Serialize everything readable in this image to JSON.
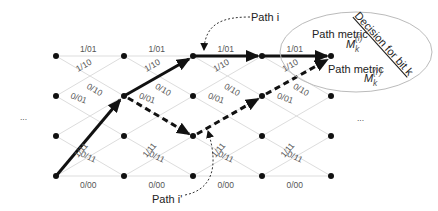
{
  "diagram": {
    "type": "trellis",
    "states": [
      "s0",
      "s1",
      "s2",
      "s3"
    ],
    "columns": 5,
    "ellipsis_left": "...",
    "ellipsis_right": "...",
    "edge_labels": {
      "top_horizontal": "1/01",
      "top_to_row1": "1/10",
      "row1_to_top": "1/10",
      "row1_to_row2": "0/10",
      "row2_to_row1": "0/01",
      "row2_to_bottom_up": "1/11",
      "row2_down": "0/01",
      "row3_to_bottom": "0/11",
      "bottom_to_row2": "1/11",
      "bottom_horizontal": "0/00"
    },
    "annotations": {
      "path_i": "Path i",
      "path_i_prime": "Path i'",
      "path_metric_1": "Path metric",
      "path_metric_2": "Path metric",
      "metric_i": "M",
      "metric_i_sub": "k",
      "metric_i_sup": "(i)",
      "metric_ip_sup": "(i')",
      "decision": "Decision for bit k"
    }
  }
}
